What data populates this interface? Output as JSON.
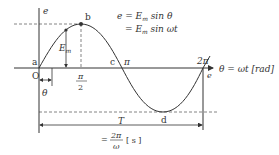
{
  "diagram": {
    "type": "sine-wave",
    "equation_line1": "e = E",
    "equation_line1_sub": "m",
    "equation_line1_rest": " sin θ",
    "equation_line2": "= E",
    "equation_line2_sub": "m",
    "equation_line2_rest": " sin ωt",
    "y_axis_label": "e",
    "x_axis_label": "θ = ωt [rad]",
    "origin_label": "O",
    "points": {
      "a": "a",
      "b": "b",
      "c": "c",
      "d": "d"
    },
    "ticks": {
      "pi_half_num": "π",
      "pi_half_den": "2",
      "pi": "π",
      "two_pi": "2π"
    },
    "amplitude_label": "E",
    "amplitude_sub": "m",
    "theta_label": "θ",
    "right_e_label": "e",
    "period_label": "T",
    "period_formula_eq": "=",
    "period_formula_num": "2π",
    "period_formula_den": "ω",
    "period_unit": "[ s ]",
    "colors": {
      "line": "#333333",
      "dash": "#666666"
    }
  }
}
